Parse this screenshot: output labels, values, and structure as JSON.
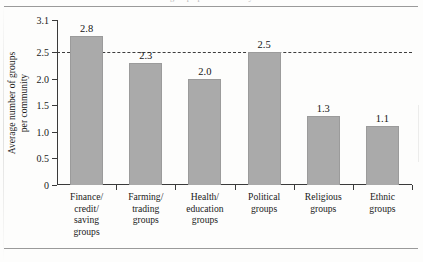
{
  "page": {
    "caption_cut_text": "groups per community"
  },
  "chart_data": {
    "type": "bar",
    "title": "",
    "xlabel": "",
    "ylabel": "Average number of groups per community",
    "ylabel_lines": [
      "Average number of groups",
      "per community"
    ],
    "categories": [
      "Finance/ credit/ saving groups",
      "Farming/ trading groups",
      "Health/ education groups",
      "Political groups",
      "Religious groups",
      "Ethnic groups"
    ],
    "category_lines": [
      [
        "Finance/",
        "credit/",
        "saving",
        "groups"
      ],
      [
        "Farming/",
        "trading",
        "groups"
      ],
      [
        "Health/",
        "education",
        "groups"
      ],
      [
        "Political",
        "groups"
      ],
      [
        "Religious",
        "groups"
      ],
      [
        "Ethnic",
        "groups"
      ]
    ],
    "values": [
      2.8,
      2.3,
      2.0,
      2.5,
      1.3,
      1.1
    ],
    "value_labels": [
      "2.8",
      "2.3",
      "2.0",
      "2.5",
      "1.3",
      "1.1"
    ],
    "ylim": [
      0,
      3.1
    ],
    "yticks": [
      0,
      0.5,
      1.0,
      1.5,
      2.0,
      2.5,
      3.1
    ],
    "ytick_labels": [
      "0",
      "0.5",
      "1.0",
      "1.5",
      "2.0",
      "2.5",
      "3.1"
    ],
    "grid": false,
    "legend": null,
    "reference_line": {
      "value": 2.5,
      "style": "dashed",
      "label": ""
    },
    "colors": {
      "bar_fill": "#aaaaaa",
      "bar_edge": "#9b9b9b",
      "axis": "#3a3a3a",
      "reference_line": "#3d3d3d",
      "text": "#1a1a1a",
      "page_background": "#fdfdfc"
    }
  }
}
